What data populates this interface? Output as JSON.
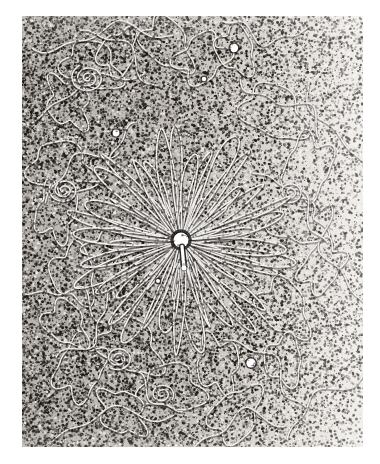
{
  "page": {
    "background_color": "#ffffff",
    "width": 380,
    "height": 464
  },
  "micrograph": {
    "name": "bacteriophage-dna-electron-micrograph",
    "subject": "lysed bacteriophage with released DNA",
    "frame": {
      "x": 22,
      "y": 16,
      "width": 341,
      "height": 431
    },
    "grain": {
      "description": "high-contrast halftone stipple of carbon support film",
      "dark_color": "#1a1714",
      "light_color": "#f4f2ef",
      "mid_color": "#8e8a85",
      "density_left": 0.62,
      "density_right": 0.3,
      "dot_count": 52000,
      "dot_min_radius": 0.35,
      "dot_max_radius": 1.5
    },
    "capsid": {
      "name": "phage-capsid",
      "center_x": 181,
      "center_y": 240,
      "radius": 7.5,
      "color": "#ffffff",
      "tail_length": 26,
      "tail_width": 3.2,
      "baseplate_y": 268
    },
    "radiating_strands": {
      "name": "dna-strand-radiating",
      "count": 38,
      "color": "#f8f6f3",
      "width": 1.6,
      "inner_radius": 9,
      "outer_radius_min": 52,
      "outer_radius_max": 118
    },
    "dna_loops": {
      "name": "dna-loop",
      "color": "#f8f6f3",
      "width": 1.5,
      "count": 34
    },
    "bright_spots": [
      {
        "name": "bright-spot-upper-right",
        "x": 234,
        "y": 48,
        "radius": 4.2
      },
      {
        "name": "bright-spot-upper-center",
        "x": 204,
        "y": 79,
        "radius": 2.2
      },
      {
        "name": "bright-spot-left",
        "x": 116,
        "y": 133,
        "radius": 3.4
      },
      {
        "name": "bright-spot-lower-right",
        "x": 251,
        "y": 363,
        "radius": 4.6
      },
      {
        "name": "bright-spot-center-low",
        "x": 158,
        "y": 281,
        "radius": 2.0
      }
    ]
  }
}
